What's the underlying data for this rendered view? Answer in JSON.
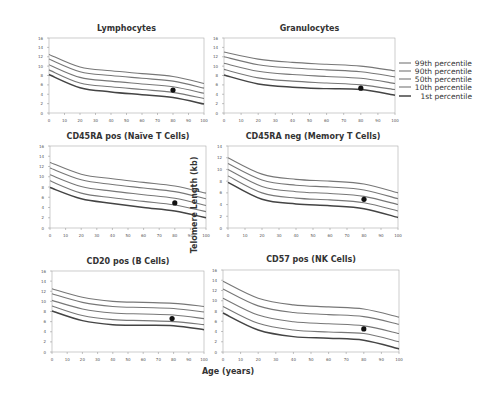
{
  "figure": {
    "ylabel": "Telomere Length (kb)",
    "xlabel": "Age (years)",
    "legend": [
      "99th percentile",
      "90th percentile",
      "50th percentile",
      "10th percentile",
      "1st percentile"
    ]
  },
  "chart_data": [
    {
      "type": "line",
      "title": "Lymphocytes",
      "x": [
        0,
        20,
        40,
        60,
        80,
        100
      ],
      "xlim": [
        0,
        100
      ],
      "ylim": [
        0,
        16
      ],
      "xticks": [
        0,
        10,
        20,
        30,
        40,
        50,
        60,
        70,
        80,
        90,
        100
      ],
      "yticks": [
        0,
        2,
        4,
        6,
        8,
        10,
        12,
        14,
        16
      ],
      "series": [
        {
          "name": "99th percentile",
          "values": [
            12.5,
            9.8,
            9.0,
            8.4,
            7.8,
            6.3
          ]
        },
        {
          "name": "90th percentile",
          "values": [
            11.5,
            8.8,
            8.0,
            7.4,
            6.8,
            5.3
          ]
        },
        {
          "name": "50th percentile",
          "values": [
            10.3,
            7.6,
            6.8,
            6.2,
            5.6,
            4.2
          ]
        },
        {
          "name": "10th percentile",
          "values": [
            9.2,
            6.4,
            5.6,
            5.0,
            4.4,
            3.1
          ]
        },
        {
          "name": "1st percentile",
          "values": [
            8.2,
            5.4,
            4.5,
            3.9,
            3.3,
            1.9
          ]
        }
      ],
      "point": {
        "x": 80,
        "y": 4.9
      }
    },
    {
      "type": "line",
      "title": "Granulocytes",
      "x": [
        0,
        20,
        40,
        60,
        80,
        100
      ],
      "xlim": [
        0,
        100
      ],
      "ylim": [
        0,
        16
      ],
      "xticks": [
        0,
        10,
        20,
        30,
        40,
        50,
        60,
        70,
        80,
        90,
        100
      ],
      "yticks": [
        0,
        2,
        4,
        6,
        8,
        10,
        12,
        14,
        16
      ],
      "series": [
        {
          "name": "99th percentile",
          "values": [
            13.0,
            11.5,
            10.8,
            10.4,
            10.0,
            9.0
          ]
        },
        {
          "name": "90th percentile",
          "values": [
            12.0,
            10.3,
            9.6,
            9.2,
            8.8,
            7.7
          ]
        },
        {
          "name": "50th percentile",
          "values": [
            10.6,
            8.9,
            8.2,
            7.8,
            7.4,
            6.3
          ]
        },
        {
          "name": "10th percentile",
          "values": [
            9.3,
            7.5,
            6.8,
            6.4,
            6.0,
            5.0
          ]
        },
        {
          "name": "1st percentile",
          "values": [
            8.1,
            6.2,
            5.5,
            5.2,
            5.0,
            3.8
          ]
        }
      ],
      "point": {
        "x": 80,
        "y": 5.3
      }
    },
    {
      "type": "line",
      "title": "CD45RA pos (Naïve T Cells)",
      "x": [
        0,
        20,
        40,
        60,
        80,
        100
      ],
      "xlim": [
        0,
        100
      ],
      "ylim": [
        0,
        16
      ],
      "xticks": [
        0,
        10,
        20,
        30,
        40,
        50,
        60,
        70,
        80,
        90,
        100
      ],
      "yticks": [
        0,
        2,
        4,
        6,
        8,
        10,
        12,
        14,
        16
      ],
      "series": [
        {
          "name": "99th percentile",
          "values": [
            12.8,
            10.5,
            9.6,
            8.9,
            8.2,
            6.8
          ]
        },
        {
          "name": "90th percentile",
          "values": [
            11.7,
            9.4,
            8.5,
            7.8,
            7.1,
            5.7
          ]
        },
        {
          "name": "50th percentile",
          "values": [
            10.4,
            8.1,
            7.2,
            6.5,
            5.8,
            4.4
          ]
        },
        {
          "name": "10th percentile",
          "values": [
            9.2,
            6.8,
            5.9,
            5.2,
            4.5,
            3.2
          ]
        },
        {
          "name": "1st percentile",
          "values": [
            7.9,
            5.7,
            4.8,
            4.0,
            3.3,
            2.0
          ]
        }
      ],
      "point": {
        "x": 80,
        "y": 4.9
      }
    },
    {
      "type": "line",
      "title": "CD45RA neg (Memory T Cells)",
      "x": [
        0,
        20,
        40,
        60,
        80,
        100
      ],
      "xlim": [
        0,
        100
      ],
      "ylim": [
        0,
        14
      ],
      "xticks": [
        0,
        10,
        20,
        30,
        40,
        50,
        60,
        70,
        80,
        90,
        100
      ],
      "yticks": [
        0,
        2,
        4,
        6,
        8,
        10,
        12,
        14
      ],
      "series": [
        {
          "name": "99th percentile",
          "values": [
            12.0,
            9.2,
            8.3,
            8.0,
            7.5,
            6.0
          ]
        },
        {
          "name": "90th percentile",
          "values": [
            11.0,
            8.2,
            7.3,
            7.0,
            6.5,
            5.0
          ]
        },
        {
          "name": "50th percentile",
          "values": [
            10.0,
            7.1,
            6.2,
            5.9,
            5.4,
            4.0
          ]
        },
        {
          "name": "10th percentile",
          "values": [
            8.9,
            6.0,
            5.1,
            4.8,
            4.3,
            2.9
          ]
        },
        {
          "name": "1st percentile",
          "values": [
            7.8,
            4.9,
            4.1,
            3.8,
            3.3,
            1.8
          ]
        }
      ],
      "point": {
        "x": 80,
        "y": 4.9
      }
    },
    {
      "type": "line",
      "title": "CD20 pos (B Cells)",
      "x": [
        0,
        20,
        40,
        60,
        80,
        100
      ],
      "xlim": [
        0,
        100
      ],
      "ylim": [
        0,
        16
      ],
      "xticks": [
        0,
        10,
        20,
        30,
        40,
        50,
        60,
        70,
        80,
        90,
        100
      ],
      "yticks": [
        0,
        2,
        4,
        6,
        8,
        10,
        12,
        14,
        16
      ],
      "series": [
        {
          "name": "99th percentile",
          "values": [
            12.5,
            10.8,
            10.0,
            9.8,
            9.6,
            9.0
          ]
        },
        {
          "name": "90th percentile",
          "values": [
            11.5,
            9.8,
            9.0,
            8.8,
            8.6,
            7.9
          ]
        },
        {
          "name": "50th percentile",
          "values": [
            10.2,
            8.5,
            7.7,
            7.5,
            7.3,
            6.6
          ]
        },
        {
          "name": "10th percentile",
          "values": [
            9.1,
            7.2,
            6.4,
            6.2,
            6.0,
            5.4
          ]
        },
        {
          "name": "1st percentile",
          "values": [
            8.1,
            6.2,
            5.4,
            5.3,
            5.2,
            4.4
          ]
        }
      ],
      "point": {
        "x": 79,
        "y": 6.6
      }
    },
    {
      "type": "line",
      "title": "CD57 pos (NK Cells)",
      "x": [
        0,
        20,
        40,
        60,
        80,
        100
      ],
      "xlim": [
        0,
        100
      ],
      "ylim": [
        0,
        16
      ],
      "xticks": [
        0,
        10,
        20,
        30,
        40,
        50,
        60,
        70,
        80,
        90,
        100
      ],
      "yticks": [
        0,
        2,
        4,
        6,
        8,
        10,
        12,
        14,
        16
      ],
      "series": [
        {
          "name": "99th percentile",
          "values": [
            13.8,
            10.5,
            9.2,
            8.8,
            8.4,
            6.8
          ]
        },
        {
          "name": "90th percentile",
          "values": [
            12.3,
            9.0,
            7.7,
            7.3,
            6.9,
            5.4
          ]
        },
        {
          "name": "50th percentile",
          "values": [
            10.5,
            7.2,
            5.9,
            5.5,
            5.1,
            3.6
          ]
        },
        {
          "name": "10th percentile",
          "values": [
            8.9,
            5.6,
            4.3,
            3.9,
            3.6,
            2.0
          ]
        },
        {
          "name": "1st percentile",
          "values": [
            7.6,
            4.3,
            3.0,
            2.7,
            2.3,
            0.6
          ]
        }
      ],
      "point": {
        "x": 80,
        "y": 4.5
      }
    }
  ]
}
